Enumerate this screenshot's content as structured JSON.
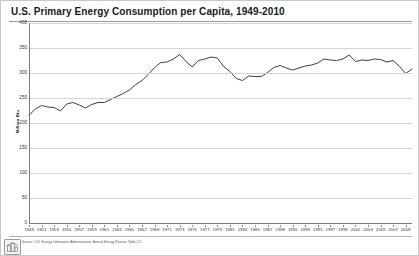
{
  "chart_data": {
    "type": "line",
    "title": "U.S. Primary Energy Consumption per Capita, 1949-2010",
    "xlabel": "",
    "ylabel": "Million Btu",
    "ylim": [
      0,
      400
    ],
    "xlim": [
      1949,
      2010
    ],
    "yticks": [
      0,
      50,
      100,
      150,
      200,
      250,
      300,
      350,
      400
    ],
    "ytick_labels": [
      "0",
      "50",
      "100",
      "150",
      "200",
      "250",
      "300",
      "350",
      "400"
    ],
    "xticks": [
      1949,
      1951,
      1953,
      1955,
      1957,
      1959,
      1961,
      1963,
      1965,
      1967,
      1969,
      1971,
      1973,
      1975,
      1977,
      1979,
      1981,
      1983,
      1985,
      1987,
      1989,
      1991,
      1993,
      1995,
      1997,
      1999,
      2001,
      2003,
      2005,
      2007,
      2009
    ],
    "xtick_labels": [
      "1949",
      "1951",
      "1953",
      "1955",
      "1957",
      "1959",
      "1961",
      "1963",
      "1965",
      "1967",
      "1969",
      "1971",
      "1973",
      "1975",
      "1977",
      "1979",
      "1981",
      "1983",
      "1985",
      "1987",
      "1989",
      "1991",
      "1993",
      "1995",
      "1997",
      "1999",
      "2001",
      "2003",
      "2005",
      "2007",
      "2009"
    ],
    "grid": true,
    "legend": false,
    "line_color": "#404040",
    "x": [
      1949,
      1950,
      1951,
      1952,
      1953,
      1954,
      1955,
      1956,
      1957,
      1958,
      1959,
      1960,
      1961,
      1962,
      1963,
      1964,
      1965,
      1966,
      1967,
      1968,
      1969,
      1970,
      1971,
      1972,
      1973,
      1974,
      1975,
      1976,
      1977,
      1978,
      1979,
      1980,
      1981,
      1982,
      1983,
      1984,
      1985,
      1986,
      1987,
      1988,
      1989,
      1990,
      1991,
      1992,
      1993,
      1994,
      1995,
      1996,
      1997,
      1998,
      1999,
      2000,
      2001,
      2002,
      2003,
      2004,
      2005,
      2006,
      2007,
      2008,
      2009,
      2010
    ],
    "y": [
      215,
      228,
      235,
      232,
      231,
      224,
      238,
      241,
      236,
      230,
      237,
      241,
      241,
      247,
      253,
      259,
      266,
      277,
      285,
      297,
      311,
      321,
      322,
      328,
      337,
      323,
      312,
      325,
      328,
      332,
      330,
      313,
      303,
      289,
      285,
      294,
      293,
      293,
      301,
      311,
      315,
      310,
      306,
      310,
      314,
      316,
      320,
      328,
      326,
      325,
      328,
      336,
      323,
      326,
      325,
      328,
      327,
      322,
      325,
      313,
      299,
      308
    ]
  },
  "footer": {
    "source": "Source: U.S. Energy Information Administration, Annual Energy Review, Table 1.5",
    "logo_label": "eia-logo"
  }
}
